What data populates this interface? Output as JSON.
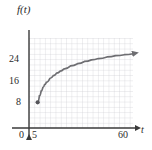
{
  "figure": {
    "background_color": "#ffffff",
    "axis_color": "#3a3a3a",
    "grid_color": "#c9c9cf",
    "curve_color": "#6e6e72",
    "text_color": "#2b2b2b"
  },
  "labels": {
    "y_axis_label": "f(t)",
    "x_axis_label": "t"
  },
  "ticks": {
    "y": [
      "24",
      "16",
      "8"
    ],
    "x": [
      "0",
      "5",
      "60"
    ]
  },
  "chart_data": {
    "type": "line",
    "title": "",
    "xlabel": "t",
    "ylabel": "f(t)",
    "xlim": [
      0,
      60
    ],
    "ylim": [
      0,
      28
    ],
    "xticks": [
      0,
      5,
      60
    ],
    "xticklabels": [
      "0",
      "5",
      "60"
    ],
    "yticks": [
      8,
      16,
      24
    ],
    "yticklabels": [
      "8",
      "16",
      "24"
    ],
    "grid": true,
    "legend": null,
    "annotations": [
      {
        "kind": "endpoint-dot",
        "x": 5,
        "y": 8,
        "filled": true
      },
      {
        "kind": "arrowhead",
        "x": 60,
        "y": 23,
        "direction": "right"
      },
      {
        "kind": "axis-arrow",
        "axis": "y",
        "direction": "up"
      },
      {
        "kind": "axis-arrow",
        "axis": "x",
        "direction": "right"
      }
    ],
    "series": [
      {
        "name": "f(t)",
        "x": [
          5,
          6,
          7,
          8,
          9,
          10,
          12,
          14,
          16,
          18,
          20,
          24,
          28,
          32,
          36,
          40,
          45,
          50,
          55,
          60
        ],
        "y": [
          8.0,
          10.0,
          11.5,
          12.6,
          13.5,
          14.2,
          15.4,
          16.3,
          17.1,
          17.7,
          18.3,
          19.3,
          20.0,
          20.7,
          21.2,
          21.6,
          22.1,
          22.5,
          22.8,
          23.1
        ]
      }
    ]
  }
}
